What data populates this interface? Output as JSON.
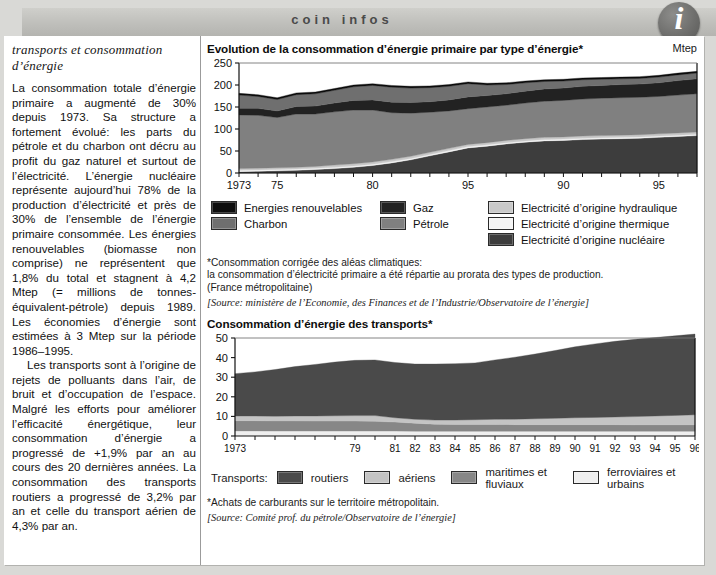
{
  "header": {
    "band_title": "coin infos",
    "info_icon_glyph": "i"
  },
  "left": {
    "kicker": "transports et consommation d’énergie",
    "paragraphs": [
      "La consommation totale d’énergie primaire a augmenté de 30% depuis 1973. Sa structure a fortement évolué: les parts du pétrole et du charbon ont décru au profit du gaz naturel et surtout de l’électricité. L’énergie nucléaire représente aujourd’hui 78% de la production d’électricité et près de 30% de l’ensemble de l’énergie primaire consommée. Les énergies renouvelables (biomasse non comprise) ne représentent que 1,8% du total et stagnent à 4,2 Mtep (= millions de tonnes-équivalent-pétrole) depuis 1989. Les économies d’énergie sont estimées à 3 Mtep sur la période 1986–1995.",
      "Les transports sont à l’origine de rejets de polluants dans l’air, de bruit et d’occupation de l’espace. Malgré les efforts pour améliorer l’efficacité énergétique, leur consommation d’énergie a progressé de +1,9% par an au cours des 20 dernières années. La consommation des transports routiers a progressé de 3,2% par an et celle du transport aérien de 4,3% par an."
    ]
  },
  "chart1": {
    "title": "Evolution de la consommation d’énergie primaire par type d’énergie*",
    "unit": "Mtep",
    "legend": [
      {
        "label": "Energies renouvelables",
        "color": "#0d0d0d"
      },
      {
        "label": "Charbon",
        "color": "#6f6f6f"
      },
      {
        "label": "Gaz",
        "color": "#222222"
      },
      {
        "label": "Pétrole",
        "color": "#808080"
      },
      {
        "label": "Electricité d’origine hydraulique",
        "color": "#c9c9c9"
      },
      {
        "label": "Electricité d’origine thermique",
        "color": "#f4f4f4"
      },
      {
        "label": "Electricité d’origine nucléaire",
        "color": "#3d3d3d"
      }
    ],
    "footnotes": [
      "*Consommation corrigée des aléas climatiques:",
      "la consommation d’électricité primaire a été répartie au prorata des types de production.",
      "(France métropolitaine)"
    ],
    "source": "[Source: ministère de l’Economie, des Finances et de l’Industrie/Observatoire de l’énergie]"
  },
  "chart2": {
    "title": "Consommation d’énergie des transports*",
    "legend_label": "Transports:",
    "legend": [
      {
        "label": "routiers",
        "color": "#4a4a4a"
      },
      {
        "label": "aériens",
        "color": "#c4c4c4"
      },
      {
        "label": "maritimes et fluviaux",
        "color": "#878787"
      },
      {
        "label": "ferroviaires et urbains",
        "color": "#efefef"
      }
    ],
    "footnotes": [
      "*Achats de carburants sur le territoire métropolitain."
    ],
    "source": "[Source: Comité prof. du pétrole/Observatoire de l’énergie]"
  },
  "chart_data": [
    {
      "type": "area",
      "title": "Evolution de la consommation d’énergie primaire par type d’énergie*",
      "xlabel": "",
      "ylabel": "Mtep",
      "ylim": [
        0,
        250
      ],
      "yticks": [
        0,
        50,
        100,
        150,
        200,
        250
      ],
      "grid": false,
      "legend_position": "below",
      "stacked": true,
      "x": [
        1973,
        1974,
        1975,
        1976,
        1977,
        1978,
        1979,
        1980,
        1981,
        1982,
        1983,
        1984,
        1985,
        1986,
        1987,
        1988,
        1989,
        1990,
        1991,
        1992,
        1993,
        1994,
        1995,
        1996,
        1997
      ],
      "xtick_labels": [
        "1973",
        "75",
        "80",
        "95",
        "90",
        "95"
      ],
      "xtick_values": [
        1973,
        1975,
        1980,
        1985,
        1990,
        1995
      ],
      "series": [
        {
          "name": "Electricité d’origine nucléaire",
          "color": "#3d3d3d",
          "values": [
            3,
            4,
            5,
            6,
            8,
            10,
            13,
            17,
            23,
            30,
            39,
            48,
            57,
            61,
            66,
            70,
            73,
            74,
            76,
            77,
            78,
            79,
            81,
            83,
            85
          ]
        },
        {
          "name": "Electricité d’origine thermique",
          "color": "#f4f4f4",
          "values": [
            3,
            3,
            3,
            3,
            3,
            3,
            3,
            3,
            3,
            3,
            3,
            3,
            3,
            3,
            3,
            3,
            3,
            3,
            3,
            3,
            3,
            3,
            3,
            3,
            3
          ]
        },
        {
          "name": "Electricité d’origine hydraulique",
          "color": "#c9c9c9",
          "values": [
            4,
            4,
            4,
            4,
            4,
            5,
            5,
            5,
            5,
            5,
            5,
            5,
            5,
            5,
            5,
            5,
            5,
            5,
            5,
            5,
            5,
            5,
            5,
            5,
            5
          ]
        },
        {
          "name": "Pétrole",
          "color": "#808080",
          "values": [
            122,
            120,
            114,
            121,
            119,
            121,
            122,
            118,
            106,
            98,
            91,
            85,
            81,
            81,
            80,
            81,
            82,
            83,
            84,
            85,
            85,
            85,
            85,
            86,
            87
          ]
        },
        {
          "name": "Gaz",
          "color": "#222222",
          "values": [
            15,
            16,
            15,
            17,
            18,
            20,
            22,
            23,
            24,
            24,
            24,
            25,
            27,
            26,
            26,
            27,
            28,
            28,
            29,
            29,
            30,
            30,
            31,
            33,
            34
          ]
        },
        {
          "name": "Charbon",
          "color": "#6f6f6f",
          "values": [
            30,
            27,
            26,
            27,
            28,
            29,
            31,
            33,
            34,
            33,
            32,
            31,
            30,
            24,
            21,
            19,
            17,
            16,
            15,
            14,
            13,
            13,
            13,
            13,
            13
          ]
        },
        {
          "name": "Energies renouvelables",
          "color": "#0d0d0d",
          "values": [
            4,
            4,
            4,
            4,
            4,
            4,
            4,
            4,
            4,
            4,
            4,
            4,
            4,
            4,
            4,
            4,
            4,
            4,
            4,
            4,
            4,
            4,
            4,
            4,
            4
          ]
        }
      ],
      "totals": [
        181,
        178,
        171,
        182,
        184,
        192,
        200,
        203,
        199,
        197,
        198,
        201,
        207,
        204,
        205,
        209,
        212,
        213,
        216,
        217,
        218,
        219,
        222,
        227,
        231
      ]
    },
    {
      "type": "area",
      "title": "Consommation d’énergie des transports*",
      "xlabel": "",
      "ylabel": "",
      "ylim": [
        0,
        50
      ],
      "yticks": [
        0,
        10,
        20,
        30,
        40,
        50
      ],
      "grid": false,
      "legend_position": "below",
      "stacked": true,
      "x": [
        1973,
        1974,
        1975,
        1976,
        1977,
        1978,
        1979,
        1980,
        1981,
        1982,
        1983,
        1984,
        1985,
        1986,
        1987,
        1988,
        1989,
        1990,
        1991,
        1992,
        1993,
        1994,
        1995,
        1996
      ],
      "xtick_labels": [
        "1973",
        "79",
        "81",
        "82",
        "83",
        "84",
        "85",
        "86",
        "87",
        "88",
        "89",
        "90",
        "91",
        "92",
        "93",
        "94",
        "95",
        "96"
      ],
      "xtick_values": [
        1973,
        1979,
        1981,
        1982,
        1983,
        1984,
        1985,
        1986,
        1987,
        1988,
        1989,
        1990,
        1991,
        1992,
        1993,
        1994,
        1995,
        1996
      ],
      "series": [
        {
          "name": "ferroviaires et urbains",
          "color": "#efefef",
          "values": [
            2.6,
            2.6,
            2.5,
            2.5,
            2.5,
            2.5,
            2.5,
            2.5,
            2.5,
            2.4,
            2.4,
            2.4,
            2.4,
            2.4,
            2.4,
            2.4,
            2.4,
            2.4,
            2.4,
            2.4,
            2.4,
            2.4,
            2.4,
            2.4
          ]
        },
        {
          "name": "maritimes et fluviaux",
          "color": "#878787",
          "values": [
            5.2,
            5.2,
            5.2,
            5.2,
            5.1,
            5.1,
            5.1,
            5.0,
            4.6,
            4.1,
            3.6,
            3.5,
            3.5,
            3.5,
            3.4,
            3.4,
            3.4,
            3.4,
            3.4,
            3.4,
            3.3,
            3.3,
            3.3,
            3.3
          ]
        },
        {
          "name": "aériens",
          "color": "#c4c4c4",
          "values": [
            2.4,
            2.4,
            2.4,
            2.5,
            2.6,
            2.7,
            2.8,
            2.9,
            2.2,
            2.0,
            2.1,
            2.2,
            2.4,
            2.6,
            2.8,
            3.0,
            3.2,
            3.5,
            3.7,
            3.9,
            4.2,
            4.5,
            4.8,
            5.1
          ]
        },
        {
          "name": "routiers",
          "color": "#4a4a4a",
          "values": [
            21.6,
            22.5,
            23.8,
            25.2,
            26.3,
            27.4,
            28.2,
            28.4,
            28.2,
            28.2,
            28.6,
            28.8,
            29.0,
            30.3,
            31.6,
            33.0,
            34.6,
            36.2,
            37.5,
            38.6,
            39.4,
            40.0,
            40.6,
            41.2
          ]
        }
      ],
      "totals": [
        31.8,
        32.7,
        33.9,
        35.4,
        36.5,
        37.7,
        38.6,
        38.8,
        37.5,
        36.7,
        36.7,
        36.9,
        37.3,
        38.8,
        40.2,
        41.8,
        43.6,
        45.5,
        47.0,
        48.3,
        49.3,
        50.2,
        51.1,
        52.0
      ]
    }
  ]
}
